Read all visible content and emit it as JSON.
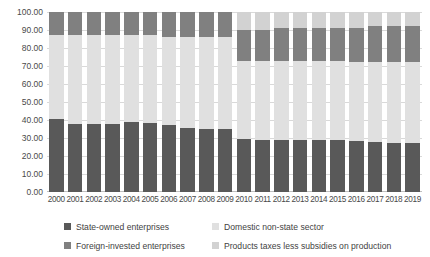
{
  "chart_data": {
    "type": "bar",
    "stacked": true,
    "title": "",
    "xlabel": "",
    "ylabel": "",
    "ylim": [
      0,
      100
    ],
    "ytick_labels": [
      "100.00",
      "90.00",
      "80.00",
      "70.00",
      "60.00",
      "50.00",
      "40.00",
      "30.00",
      "20.00",
      "10.00",
      "0.00"
    ],
    "ytick_values": [
      100,
      90,
      80,
      70,
      60,
      50,
      40,
      30,
      20,
      10,
      0
    ],
    "grid": true,
    "legend_position": "bottom",
    "categories": [
      "2000",
      "2001",
      "2002",
      "2003",
      "2004",
      "2005",
      "2006",
      "2007",
      "2008",
      "2009",
      "2010",
      "2011",
      "2012",
      "2013",
      "2014",
      "2015",
      "2016",
      "2017",
      "2018",
      "2019"
    ],
    "series": [
      {
        "name": "State-owned enterprises",
        "color": "#595959",
        "values": [
          40.5,
          38.0,
          38.0,
          38.0,
          39.0,
          38.5,
          37.5,
          35.5,
          35.0,
          35.0,
          29.5,
          29.0,
          29.0,
          29.0,
          29.0,
          29.0,
          28.5,
          28.0,
          27.5,
          27.5
        ]
      },
      {
        "name": "Domestic non-state sector",
        "color": "#e0e0e0",
        "values": [
          47.0,
          49.0,
          49.0,
          49.0,
          48.0,
          48.5,
          48.5,
          50.5,
          51.0,
          51.0,
          43.5,
          44.0,
          44.0,
          44.0,
          44.0,
          44.0,
          44.0,
          44.5,
          45.0,
          45.0
        ]
      },
      {
        "name": "Foreign-invested enterprises",
        "color": "#808080",
        "values": [
          12.5,
          13.0,
          13.0,
          13.0,
          13.0,
          13.0,
          14.0,
          14.0,
          14.0,
          14.0,
          17.0,
          17.0,
          18.0,
          18.0,
          18.0,
          18.0,
          18.5,
          19.5,
          20.0,
          20.0
        ]
      },
      {
        "name": "Products taxes less subsidies on production",
        "color": "#d2d2d2",
        "values": [
          0,
          0,
          0,
          0,
          0,
          0,
          0,
          0,
          0,
          0,
          10.0,
          10.0,
          9.0,
          9.0,
          9.0,
          9.0,
          9.0,
          8.0,
          7.5,
          7.5
        ]
      }
    ]
  },
  "legend": {
    "items": [
      {
        "label": "State-owned enterprises",
        "color": "#595959",
        "icon": "legend-swatch-icon"
      },
      {
        "label": "Domestic non-state sector",
        "color": "#e0e0e0",
        "icon": "legend-swatch-icon"
      },
      {
        "label": "Foreign-invested enterprises",
        "color": "#808080",
        "icon": "legend-swatch-icon"
      },
      {
        "label": "Products taxes less subsidies on production",
        "color": "#d2d2d2",
        "icon": "legend-swatch-icon"
      }
    ]
  }
}
